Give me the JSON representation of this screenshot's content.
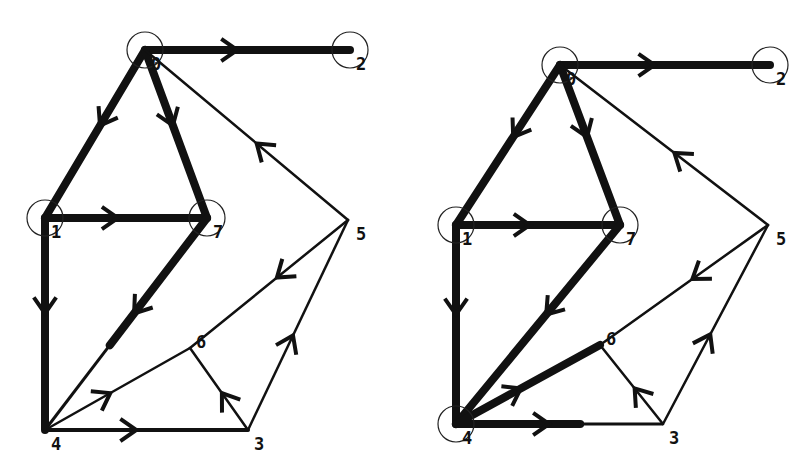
{
  "figure": {
    "colors": {
      "edge": "#111111",
      "node_circle": "#222222",
      "background": "#ffffff"
    }
  },
  "graphs": [
    {
      "name": "left",
      "nodes": [
        {
          "id": "0",
          "label": "0",
          "x": 145,
          "y": 50,
          "circled": true
        },
        {
          "id": "2",
          "label": "2",
          "x": 350,
          "y": 50,
          "circled": true
        },
        {
          "id": "1",
          "label": "1",
          "x": 45,
          "y": 218,
          "circled": true
        },
        {
          "id": "7",
          "label": "7",
          "x": 207,
          "y": 218,
          "circled": true
        },
        {
          "id": "5",
          "label": "5",
          "x": 348,
          "y": 220,
          "circled": false
        },
        {
          "id": "6",
          "label": "6",
          "x": 190,
          "y": 348,
          "circled": false
        },
        {
          "id": "4",
          "label": "4",
          "x": 45,
          "y": 430,
          "circled": false
        },
        {
          "id": "3",
          "label": "3",
          "x": 248,
          "y": 430,
          "circled": false
        }
      ],
      "edges": [
        {
          "from": "0",
          "to": "2",
          "weight": "thick"
        },
        {
          "from": "0",
          "to": "1",
          "weight": "thick"
        },
        {
          "from": "0",
          "to": "7",
          "weight": "thick"
        },
        {
          "from": "5",
          "to": "0",
          "weight": "thin"
        },
        {
          "from": "1",
          "to": "7",
          "weight": "thick"
        },
        {
          "from": "1",
          "to": "4",
          "weight": "thick"
        },
        {
          "from": "7",
          "to": "4",
          "weight": "thick-partial"
        },
        {
          "from": "5",
          "to": "6",
          "weight": "thin"
        },
        {
          "from": "4",
          "to": "6",
          "weight": "thin"
        },
        {
          "from": "3",
          "to": "5",
          "weight": "thin"
        },
        {
          "from": "4",
          "to": "3",
          "weight": "medium"
        },
        {
          "from": "3",
          "to": "6",
          "weight": "thin"
        }
      ]
    },
    {
      "name": "right",
      "nodes": [
        {
          "id": "0",
          "label": "0",
          "x": 560,
          "y": 65,
          "circled": true
        },
        {
          "id": "2",
          "label": "2",
          "x": 770,
          "y": 65,
          "circled": true
        },
        {
          "id": "1",
          "label": "1",
          "x": 456,
          "y": 225,
          "circled": true
        },
        {
          "id": "7",
          "label": "7",
          "x": 620,
          "y": 225,
          "circled": true
        },
        {
          "id": "5",
          "label": "5",
          "x": 768,
          "y": 225,
          "circled": false
        },
        {
          "id": "6",
          "label": "6",
          "x": 600,
          "y": 345,
          "circled": false
        },
        {
          "id": "4",
          "label": "4",
          "x": 456,
          "y": 424,
          "circled": true
        },
        {
          "id": "3",
          "label": "3",
          "x": 663,
          "y": 424,
          "circled": false
        }
      ],
      "edges": [
        {
          "from": "0",
          "to": "2",
          "weight": "thick"
        },
        {
          "from": "0",
          "to": "1",
          "weight": "thick"
        },
        {
          "from": "0",
          "to": "7",
          "weight": "thick"
        },
        {
          "from": "5",
          "to": "0",
          "weight": "thin"
        },
        {
          "from": "1",
          "to": "7",
          "weight": "thick"
        },
        {
          "from": "1",
          "to": "4",
          "weight": "thick"
        },
        {
          "from": "7",
          "to": "4",
          "weight": "thick"
        },
        {
          "from": "5",
          "to": "6",
          "weight": "thin"
        },
        {
          "from": "4",
          "to": "6",
          "weight": "thick"
        },
        {
          "from": "3",
          "to": "5",
          "weight": "thin"
        },
        {
          "from": "4",
          "to": "3",
          "weight": "thick-partial"
        },
        {
          "from": "3",
          "to": "6",
          "weight": "thin"
        }
      ]
    }
  ]
}
